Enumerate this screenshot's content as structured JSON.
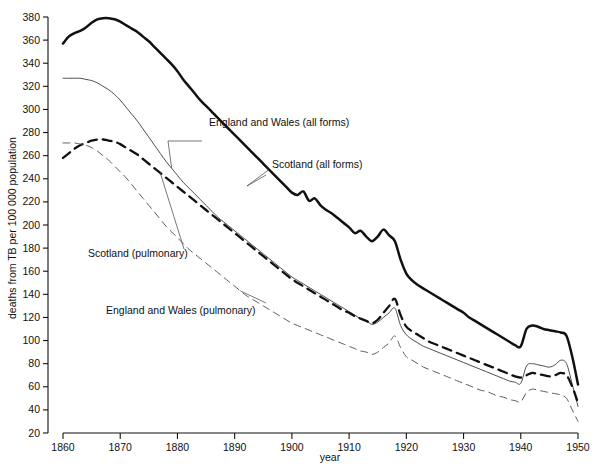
{
  "chart_data": {
    "type": "line",
    "title": "",
    "xlabel": "year",
    "ylabel": "deaths from TB per 100 000 population",
    "xlim": [
      1858,
      1950
    ],
    "ylim": [
      20,
      380
    ],
    "grid": false,
    "legend_position": "inline-annotations",
    "x_ticks": [
      1860,
      1870,
      1880,
      1890,
      1900,
      1910,
      1920,
      1930,
      1940,
      1950
    ],
    "y_ticks": [
      20,
      40,
      60,
      80,
      100,
      120,
      140,
      160,
      180,
      200,
      220,
      240,
      260,
      280,
      300,
      320,
      340,
      360,
      380
    ],
    "annotations": [
      {
        "text": "England and Wales (all forms)",
        "target_series": "England and Wales (all forms)"
      },
      {
        "text": "Scotland (all forms)",
        "target_series": "Scotland (all forms)"
      },
      {
        "text": "Scotland (pulmonary)",
        "target_series": "Scotland (pulmonary)"
      },
      {
        "text": "England and Wales (pulmonary)",
        "target_series": "England and Wales (pulmonary)"
      }
    ],
    "series": [
      {
        "name": "Scotland (all forms)",
        "style": "thick-solid",
        "color": "#111111",
        "x": [
          1860,
          1861,
          1862,
          1863,
          1864,
          1865,
          1866,
          1867,
          1868,
          1869,
          1870,
          1871,
          1872,
          1873,
          1874,
          1875,
          1876,
          1877,
          1878,
          1879,
          1880,
          1881,
          1882,
          1883,
          1884,
          1885,
          1886,
          1887,
          1888,
          1889,
          1890,
          1891,
          1892,
          1893,
          1894,
          1895,
          1896,
          1897,
          1898,
          1899,
          1900,
          1901,
          1902,
          1903,
          1904,
          1905,
          1906,
          1907,
          1908,
          1909,
          1910,
          1911,
          1912,
          1913,
          1914,
          1915,
          1916,
          1917,
          1918,
          1919,
          1920,
          1921,
          1922,
          1923,
          1924,
          1925,
          1926,
          1927,
          1928,
          1929,
          1930,
          1931,
          1932,
          1933,
          1934,
          1935,
          1936,
          1937,
          1938,
          1939,
          1940,
          1941,
          1942,
          1943,
          1944,
          1945,
          1946,
          1947,
          1948,
          1949,
          1950
        ],
        "values": [
          357,
          363,
          366,
          368,
          371,
          375,
          378,
          379,
          379,
          378,
          376,
          373,
          370,
          367,
          363,
          359,
          354,
          349,
          344,
          339,
          333,
          326,
          320,
          314,
          308,
          303,
          298,
          293,
          288,
          283,
          278,
          273,
          268,
          263,
          258,
          253,
          248,
          243,
          238,
          233,
          228,
          226,
          229,
          221,
          223,
          217,
          213,
          210,
          206,
          202,
          198,
          193,
          195,
          190,
          186,
          190,
          196,
          191,
          186,
          170,
          158,
          152,
          148,
          145,
          142,
          139,
          136,
          133,
          130,
          127,
          124,
          120,
          117,
          114,
          111,
          108,
          105,
          102,
          99,
          96,
          95,
          110,
          113,
          112,
          110,
          109,
          108,
          107,
          104,
          86,
          62
        ],
        "note": "peak ~379 in 1866-1868; wartime bumps 1915-1918 and 1941"
      },
      {
        "name": "England and Wales (all forms)",
        "style": "thin-solid",
        "color": "#3a3a3a",
        "x": [
          1860,
          1861,
          1862,
          1863,
          1864,
          1865,
          1866,
          1867,
          1868,
          1869,
          1870,
          1871,
          1872,
          1873,
          1874,
          1875,
          1876,
          1877,
          1878,
          1879,
          1880,
          1881,
          1882,
          1883,
          1884,
          1885,
          1886,
          1887,
          1888,
          1889,
          1890,
          1891,
          1892,
          1893,
          1894,
          1895,
          1896,
          1897,
          1898,
          1899,
          1900,
          1901,
          1902,
          1903,
          1904,
          1905,
          1906,
          1907,
          1908,
          1909,
          1910,
          1911,
          1912,
          1913,
          1914,
          1915,
          1916,
          1917,
          1918,
          1919,
          1920,
          1921,
          1922,
          1923,
          1924,
          1925,
          1926,
          1927,
          1928,
          1929,
          1930,
          1931,
          1932,
          1933,
          1934,
          1935,
          1936,
          1937,
          1938,
          1939,
          1940,
          1941,
          1942,
          1943,
          1944,
          1945,
          1946,
          1947,
          1948,
          1949,
          1950
        ],
        "values": [
          327,
          327,
          327,
          327,
          326,
          325,
          323,
          320,
          317,
          313,
          308,
          302,
          296,
          290,
          283,
          276,
          269,
          262,
          255,
          249,
          243,
          237,
          232,
          227,
          222,
          217,
          212,
          207,
          203,
          199,
          195,
          191,
          187,
          183,
          179,
          175,
          171,
          167,
          163,
          159,
          155,
          152,
          149,
          146,
          143,
          140,
          137,
          134,
          131,
          128,
          125,
          122,
          119,
          117,
          114,
          116,
          120,
          124,
          128,
          113,
          105,
          101,
          98,
          95,
          93,
          91,
          89,
          87,
          85,
          83,
          81,
          79,
          77,
          75,
          73,
          71,
          69,
          67,
          65,
          64,
          63,
          78,
          80,
          79,
          78,
          77,
          79,
          83,
          80,
          62,
          43
        ],
        "note": "plateau ~327 to 1864 then steady decline; 1918 influenza bump"
      },
      {
        "name": "Scotland (pulmonary)",
        "style": "thick-dashed",
        "color": "#111111",
        "x": [
          1860,
          1861,
          1862,
          1863,
          1864,
          1865,
          1866,
          1867,
          1868,
          1869,
          1870,
          1871,
          1872,
          1873,
          1874,
          1875,
          1876,
          1877,
          1878,
          1879,
          1880,
          1881,
          1882,
          1883,
          1884,
          1885,
          1886,
          1887,
          1888,
          1889,
          1890,
          1891,
          1892,
          1893,
          1894,
          1895,
          1896,
          1897,
          1898,
          1899,
          1900,
          1901,
          1902,
          1903,
          1904,
          1905,
          1906,
          1907,
          1908,
          1909,
          1910,
          1911,
          1912,
          1913,
          1914,
          1915,
          1916,
          1917,
          1918,
          1919,
          1920,
          1921,
          1922,
          1923,
          1924,
          1925,
          1926,
          1927,
          1928,
          1929,
          1930,
          1931,
          1932,
          1933,
          1934,
          1935,
          1936,
          1937,
          1938,
          1939,
          1940,
          1941,
          1942,
          1943,
          1944,
          1945,
          1946,
          1947,
          1948,
          1949,
          1950
        ],
        "values": [
          258,
          262,
          266,
          269,
          271,
          273,
          274,
          274,
          273,
          272,
          270,
          267,
          264,
          261,
          257,
          253,
          249,
          245,
          241,
          237,
          233,
          229,
          225,
          221,
          217,
          213,
          209,
          205,
          201,
          197,
          193,
          189,
          185,
          181,
          177,
          173,
          169,
          165,
          161,
          157,
          153,
          150,
          147,
          144,
          141,
          138,
          135,
          132,
          129,
          126,
          124,
          121,
          119,
          117,
          115,
          118,
          124,
          130,
          136,
          122,
          112,
          108,
          105,
          102,
          99,
          97,
          95,
          93,
          91,
          89,
          87,
          85,
          83,
          81,
          79,
          77,
          75,
          73,
          71,
          69,
          68,
          70,
          72,
          71,
          70,
          69,
          70,
          72,
          70,
          60,
          46
        ],
        "note": "peak ~274 around 1866-1867; crosses E&W pulmonary near 1863"
      },
      {
        "name": "England and Wales (pulmonary)",
        "style": "thin-dashed",
        "color": "#4a4a4a",
        "x": [
          1860,
          1861,
          1862,
          1863,
          1864,
          1865,
          1866,
          1867,
          1868,
          1869,
          1870,
          1871,
          1872,
          1873,
          1874,
          1875,
          1876,
          1877,
          1878,
          1879,
          1880,
          1881,
          1882,
          1883,
          1884,
          1885,
          1886,
          1887,
          1888,
          1889,
          1890,
          1891,
          1892,
          1893,
          1894,
          1895,
          1896,
          1897,
          1898,
          1899,
          1900,
          1901,
          1902,
          1903,
          1904,
          1905,
          1906,
          1907,
          1908,
          1909,
          1910,
          1911,
          1912,
          1913,
          1914,
          1915,
          1916,
          1917,
          1918,
          1919,
          1920,
          1921,
          1922,
          1923,
          1924,
          1925,
          1926,
          1927,
          1928,
          1929,
          1930,
          1931,
          1932,
          1933,
          1934,
          1935,
          1936,
          1937,
          1938,
          1939,
          1940,
          1941,
          1942,
          1943,
          1944,
          1945,
          1946,
          1947,
          1948,
          1949,
          1950
        ],
        "values": [
          271,
          271,
          271,
          270,
          269,
          267,
          264,
          260,
          256,
          251,
          246,
          241,
          235,
          229,
          223,
          217,
          211,
          205,
          199,
          194,
          189,
          184,
          179,
          175,
          171,
          167,
          163,
          159,
          155,
          151,
          147,
          143,
          139,
          136,
          133,
          130,
          127,
          124,
          121,
          118,
          115,
          113,
          111,
          109,
          107,
          105,
          103,
          101,
          99,
          97,
          95,
          93,
          91,
          90,
          88,
          90,
          94,
          98,
          104,
          94,
          86,
          83,
          80,
          77,
          75,
          73,
          71,
          69,
          67,
          65,
          63,
          61,
          59,
          57,
          56,
          54,
          52,
          51,
          49,
          48,
          47,
          55,
          58,
          57,
          56,
          55,
          54,
          53,
          50,
          40,
          30
        ],
        "note": "highest at 1860 (~271), steepest early decline, lowest by 1950"
      }
    ]
  }
}
